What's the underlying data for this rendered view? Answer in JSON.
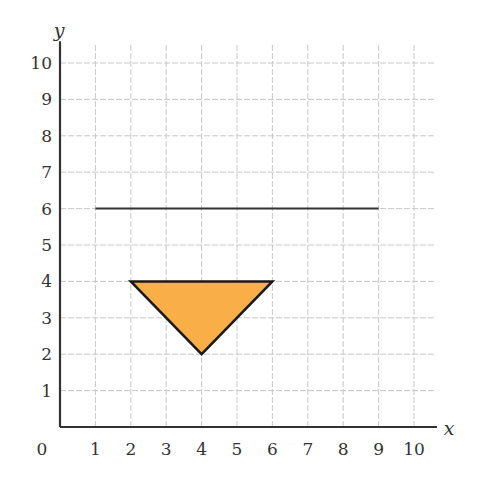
{
  "chart_data": {
    "type": "line",
    "title": "",
    "xlabel": "x",
    "ylabel": "y",
    "xlim": [
      0,
      10
    ],
    "ylim": [
      0,
      10
    ],
    "grid": true,
    "origin_label": "0",
    "x_ticks": [
      "1",
      "2",
      "3",
      "4",
      "5",
      "6",
      "7",
      "8",
      "9",
      "10"
    ],
    "y_ticks": [
      "1",
      "2",
      "3",
      "4",
      "5",
      "6",
      "7",
      "8",
      "9",
      "10"
    ],
    "shapes": [
      {
        "name": "line-of-reflection",
        "kind": "segment",
        "points": [
          [
            1,
            6
          ],
          [
            9,
            6
          ]
        ],
        "stroke": "#333333"
      },
      {
        "name": "triangle",
        "kind": "polygon",
        "points": [
          [
            2,
            4
          ],
          [
            6,
            4
          ],
          [
            4,
            2
          ]
        ],
        "fill": "#F9AE48",
        "stroke": "#1a1a1a"
      }
    ]
  },
  "colors": {
    "grid": "#c8c8c8",
    "axis": "#333333",
    "triangle_fill": "#F9AE48"
  }
}
